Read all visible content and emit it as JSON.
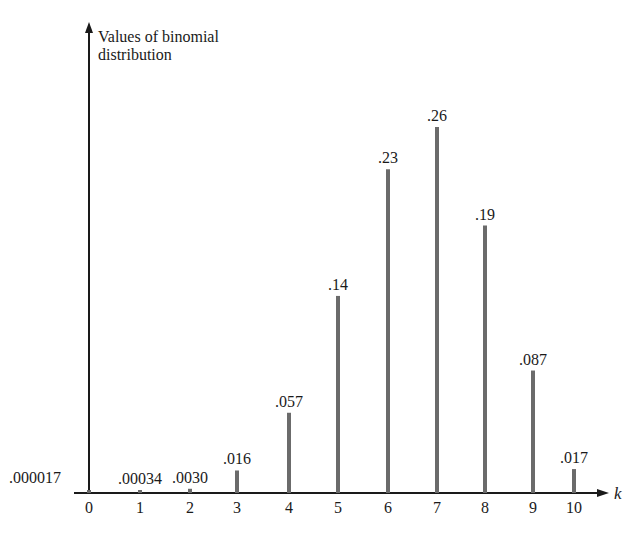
{
  "chart_data": {
    "type": "bar",
    "title": "",
    "ylabel": "Values of binomial distribution",
    "xlabel": "k",
    "categories": [
      "0",
      "1",
      "2",
      "3",
      "4",
      "5",
      "6",
      "7",
      "8",
      "9",
      "10"
    ],
    "values": [
      1.7e-05,
      0.00034,
      0.003,
      0.016,
      0.057,
      0.14,
      0.23,
      0.26,
      0.19,
      0.087,
      0.017
    ],
    "value_labels": [
      ".000017",
      ".00034",
      ".0030",
      ".016",
      ".057",
      ".14",
      ".23",
      ".26",
      ".19",
      ".087",
      ".017"
    ],
    "ylim": [
      0,
      0.28
    ],
    "grid": false,
    "legend": null,
    "bar_style": "vertical spikes (lines)",
    "colors": {
      "bars": "#6b6b6b",
      "axes": "#1a1a1a",
      "text": "#1a1a1a"
    }
  },
  "axes": {
    "y_label_line1": "Values of binomial",
    "y_label_line2": "distribution",
    "x_label": "k"
  }
}
